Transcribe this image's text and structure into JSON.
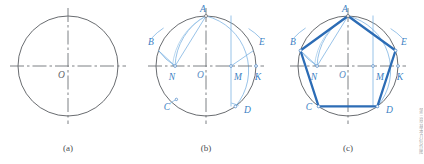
{
  "figure": {
    "background_color": "#ffffff",
    "colors": {
      "circle_stroke": "#585b60",
      "centerline_stroke": "#6e7277",
      "construction_blue": "#7fb4e2",
      "pentagon_blue": "#2c6cb5",
      "label_blue": "#3b7fc4",
      "label_gray": "#62666b",
      "caption_gray": "#4a4d51"
    }
  },
  "panels": [
    {
      "id": "panel-a",
      "caption": "(a)",
      "caption_x": 68,
      "caption_y": 151,
      "circle": {
        "cx": 68,
        "cy": 66,
        "r": 50
      },
      "center_label": {
        "text": "O",
        "x": 58,
        "y": 78
      },
      "horizontal_centerline": {
        "x1": 10,
        "y1": 66,
        "x2": 126,
        "y2": 66
      },
      "vertical_centerline": {
        "x1": 68,
        "y1": 8,
        "x2": 68,
        "y2": 124
      },
      "vertex_labels": [],
      "pentagon_visible": false,
      "construction_visible": false
    },
    {
      "id": "panel-b",
      "caption": "(b)",
      "caption_x": 206,
      "caption_y": 151,
      "circle": {
        "cx": 206,
        "cy": 66,
        "r": 50
      },
      "center_label": {
        "text": "O",
        "x": 197,
        "y": 78
      },
      "horizontal_centerline": {
        "x1": 148,
        "y1": 66,
        "x2": 264,
        "y2": 66
      },
      "vertical_centerline": {
        "x1": 206,
        "y1": 8,
        "x2": 206,
        "y2": 124
      },
      "vertex_labels": [
        {
          "text": "A",
          "x": 203,
          "y": 12,
          "anchor": "middle"
        },
        {
          "text": "B",
          "x": 148,
          "y": 45,
          "anchor": "start"
        },
        {
          "text": "E",
          "x": 259,
          "y": 45,
          "anchor": "start"
        },
        {
          "text": "N",
          "x": 172,
          "y": 80,
          "anchor": "middle"
        },
        {
          "text": "M",
          "x": 238,
          "y": 80,
          "anchor": "middle"
        },
        {
          "text": "K",
          "x": 258,
          "y": 80,
          "anchor": "middle"
        },
        {
          "text": "C",
          "x": 167,
          "y": 110,
          "anchor": "middle"
        },
        {
          "text": "D",
          "x": 244,
          "y": 113,
          "anchor": "start"
        }
      ],
      "pentagon_visible": false,
      "construction_visible": true
    },
    {
      "id": "panel-c",
      "caption": "(c)",
      "caption_x": 348,
      "caption_y": 151,
      "circle": {
        "cx": 348,
        "cy": 66,
        "r": 50
      },
      "center_label": {
        "text": "O",
        "x": 339,
        "y": 78
      },
      "horizontal_centerline": {
        "x1": 290,
        "y1": 66,
        "x2": 406,
        "y2": 66
      },
      "vertical_centerline": {
        "x1": 348,
        "y1": 8,
        "x2": 348,
        "y2": 124
      },
      "vertex_labels": [
        {
          "text": "A",
          "x": 345,
          "y": 12,
          "anchor": "middle"
        },
        {
          "text": "B",
          "x": 290,
          "y": 45,
          "anchor": "start"
        },
        {
          "text": "E",
          "x": 401,
          "y": 45,
          "anchor": "start"
        },
        {
          "text": "N",
          "x": 314,
          "y": 80,
          "anchor": "middle"
        },
        {
          "text": "M",
          "x": 380,
          "y": 80,
          "anchor": "middle"
        },
        {
          "text": "K",
          "x": 400,
          "y": 80,
          "anchor": "middle"
        },
        {
          "text": "C",
          "x": 309,
          "y": 110,
          "anchor": "middle"
        },
        {
          "text": "D",
          "x": 386,
          "y": 113,
          "anchor": "start"
        }
      ],
      "pentagon_visible": true,
      "construction_visible": true
    }
  ],
  "construction": {
    "radius": 50,
    "points_relative": {
      "A": {
        "dx": 0,
        "dy": -50,
        "name": "top-vertex"
      },
      "B": {
        "dx": -47.55,
        "dy": -15.45,
        "name": "upper-left-vertex"
      },
      "E": {
        "dx": 47.55,
        "dy": -15.45,
        "name": "upper-right-vertex"
      },
      "C": {
        "dx": -29.39,
        "dy": 40.45,
        "name": "lower-left-vertex"
      },
      "D": {
        "dx": 29.39,
        "dy": 40.45,
        "name": "lower-right-vertex"
      },
      "M": {
        "dx": 25,
        "dy": 0,
        "name": "midpoint-right-radius"
      },
      "K": {
        "dx": 50,
        "dy": 0,
        "name": "right-axis-intersection"
      },
      "N": {
        "dx": -30.9,
        "dy": 0,
        "name": "arc-intersection-on-horizontal"
      },
      "O": {
        "dx": 0,
        "dy": 0,
        "name": "center"
      }
    },
    "arc_from_M_radius": 55.9,
    "arc_from_A_radius": 58.8,
    "chord_AN_length": 58.8
  },
  "margin_note": "第三章 基本几何作图",
  "icons": {
    "figure": "geometry-figure-icon"
  }
}
